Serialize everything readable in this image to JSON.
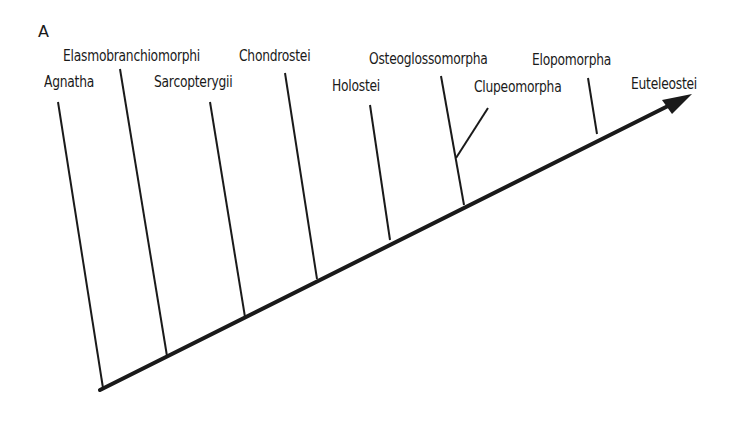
{
  "figure": {
    "panel_label": "A",
    "type": "cladogram",
    "colors": {
      "line": "#1a1a1a",
      "background": "#ffffff"
    }
  },
  "taxa": [
    {
      "name": "Agnatha",
      "label_x": 44,
      "label_y": 75,
      "top": [
        58,
        102
      ],
      "base": [
        103,
        388
      ]
    },
    {
      "name": "Elasmobranchiomorphi",
      "label_x": 63,
      "label_y": 49,
      "top": [
        120,
        69
      ],
      "base": [
        167,
        356
      ]
    },
    {
      "name": "Sarcopterygii",
      "label_x": 154,
      "label_y": 75,
      "top": [
        210,
        102
      ],
      "base": [
        245,
        317
      ]
    },
    {
      "name": "Chondrostei",
      "label_x": 239,
      "label_y": 49,
      "top": [
        285,
        73
      ],
      "base": [
        317,
        279
      ]
    },
    {
      "name": "Holostei",
      "label_x": 332,
      "label_y": 79,
      "top": [
        370,
        105
      ],
      "base": [
        390,
        240
      ]
    },
    {
      "name": "Osteoglossomorpha",
      "label_x": 369,
      "label_y": 52,
      "top": [
        441,
        76
      ],
      "base": [
        464,
        205
      ]
    },
    {
      "name": "Clupeomorpha",
      "label_x": 474,
      "label_y": 80,
      "top": [
        488,
        108
      ],
      "branch_from": [
        456,
        157
      ]
    },
    {
      "name": "Elopomorpha",
      "label_x": 532,
      "label_y": 53,
      "top": [
        588,
        78
      ],
      "base": [
        597,
        134
      ]
    },
    {
      "name": "Euteleostei",
      "label_x": 631,
      "label_y": 77
    }
  ],
  "axis": {
    "start": [
      100,
      390
    ],
    "end": [
      690,
      95
    ],
    "arrow": true
  }
}
